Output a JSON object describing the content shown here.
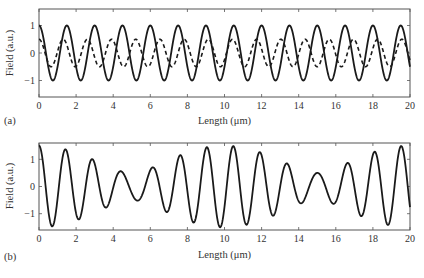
{
  "figure": {
    "panels": [
      {
        "label": "(a)"
      },
      {
        "label": "(b)"
      }
    ]
  },
  "chart_data": [
    {
      "type": "line",
      "panel": "(a)",
      "title": "",
      "xlabel": "Length (μm)",
      "ylabel": "Field (a.u.)",
      "xlim": [
        0,
        20
      ],
      "ylim": [
        -1.6,
        1.6
      ],
      "xticks": [
        0,
        2,
        4,
        6,
        8,
        10,
        12,
        14,
        16,
        18,
        20
      ],
      "yticks": [
        -1,
        0,
        1
      ],
      "grid": false,
      "legend": null,
      "series": [
        {
          "name": "wave 1 (solid)",
          "style": "solid",
          "function": "A*cos(2*pi*x/P)",
          "amplitude": 1.0,
          "period_um": 1.5,
          "color": "#1a1a1a"
        },
        {
          "name": "wave 2 (dashed)",
          "style": "dashed",
          "function": "A*cos(2*pi*x/P)",
          "amplitude": 0.5,
          "period_um": 1.304,
          "color": "#1a1a1a"
        }
      ]
    },
    {
      "type": "line",
      "panel": "(b)",
      "title": "",
      "xlabel": "Length (μm)",
      "ylabel": "Field (a.u.)",
      "xlim": [
        0,
        20
      ],
      "ylim": [
        -1.6,
        1.6
      ],
      "xticks": [
        0,
        2,
        4,
        6,
        8,
        10,
        12,
        14,
        16,
        18,
        20
      ],
      "yticks": [
        -1,
        0,
        1
      ],
      "grid": false,
      "legend": null,
      "series": [
        {
          "name": "superposition (solid)",
          "style": "solid",
          "function": "cos(2*pi*x/1.5) + 0.5*cos(2*pi*x/1.304)",
          "components": [
            {
              "amplitude": 1.0,
              "period_um": 1.5
            },
            {
              "amplitude": 0.5,
              "period_um": 1.304
            }
          ],
          "envelope_max": 1.5,
          "envelope_min": 0.5,
          "beat_length_um": 10,
          "color": "#1a1a1a"
        }
      ]
    }
  ]
}
